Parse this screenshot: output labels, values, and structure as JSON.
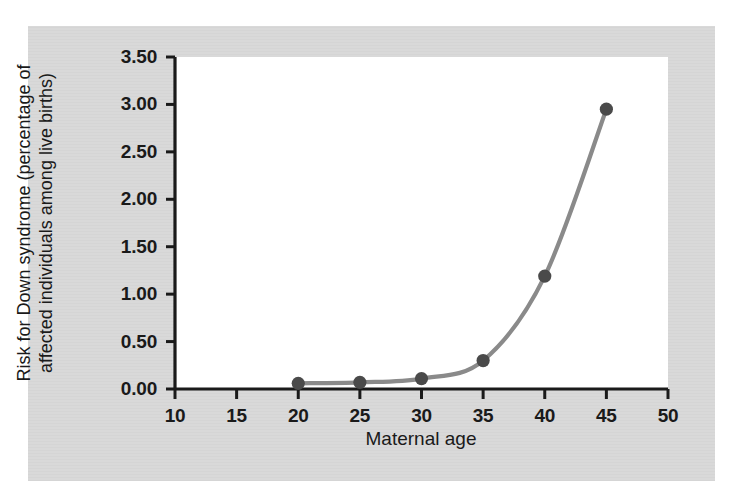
{
  "figure": {
    "background_color": "#d9d9d9",
    "page_color": "#ffffff",
    "plot_background": "#ffffff"
  },
  "chart_data": {
    "type": "line",
    "title": "",
    "xlabel": "Maternal age",
    "ylabel_line1": "Risk for Down syndrome (percentage of",
    "ylabel_line2": "affected individuals among live births)",
    "ylabel": "Risk for Down syndrome (percentage of affected individuals among live births)",
    "x": [
      20,
      25,
      30,
      35,
      40,
      45
    ],
    "values": [
      0.06,
      0.07,
      0.11,
      0.3,
      1.19,
      2.95
    ],
    "series": [
      {
        "name": "Risk for Down syndrome",
        "x": [
          20,
          25,
          30,
          35,
          40,
          45
        ],
        "values": [
          0.06,
          0.07,
          0.11,
          0.3,
          1.19,
          2.95
        ]
      }
    ],
    "xlim": [
      10,
      50
    ],
    "ylim": [
      0.0,
      3.5
    ],
    "xticks": [
      10,
      15,
      20,
      25,
      30,
      35,
      40,
      45,
      50
    ],
    "xtick_labels": [
      "10",
      "15",
      "20",
      "25",
      "30",
      "35",
      "40",
      "45",
      "50"
    ],
    "yticks": [
      0.0,
      0.5,
      1.0,
      1.5,
      2.0,
      2.5,
      3.0,
      3.5
    ],
    "ytick_labels": [
      "0.00",
      "0.50",
      "1.00",
      "1.50",
      "2.00",
      "2.50",
      "3.00",
      "3.50"
    ],
    "grid": false,
    "legend": null,
    "line_color": "#8a8a8a",
    "marker_color": "#4a4a4a",
    "marker_shape": "circle",
    "axis_color": "#1a1a1a"
  }
}
